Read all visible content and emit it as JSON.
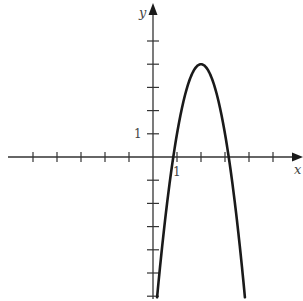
{
  "chart_data": {
    "type": "line",
    "title": "",
    "xlabel": "x",
    "ylabel": "y",
    "xlim": [
      -5.3,
      6.2
    ],
    "ylim": [
      -6.2,
      6.3
    ],
    "grid": false,
    "legend": null,
    "x_tick_step": 1,
    "y_tick_step": 1,
    "x_ticks": [
      -5,
      -4,
      -3,
      -2,
      -1,
      1,
      2,
      3,
      4,
      5
    ],
    "y_ticks": [
      -6,
      -5,
      -4,
      -3,
      -2,
      -1,
      1,
      2,
      3,
      4,
      5
    ],
    "tick_labels": {
      "x": "1",
      "y": "1"
    },
    "series": [
      {
        "name": "parabola",
        "equation_estimate": "y = -3(x - 2)^2 + 4",
        "vertex": [
          2,
          4
        ],
        "x_intercepts": [
          0.85,
          3.15
        ],
        "x": [
          0.17,
          0.5,
          0.85,
          1.0,
          1.5,
          2.0,
          2.5,
          3.0,
          3.15,
          3.5,
          3.83
        ],
        "values": [
          -6.0,
          -2.75,
          0.0,
          1.0,
          3.25,
          4.0,
          3.25,
          1.0,
          0.0,
          -2.75,
          -6.0
        ]
      }
    ]
  },
  "labels": {
    "x_axis": "x",
    "y_axis": "y",
    "x_tick_one": "1",
    "y_tick_one": "1"
  },
  "style": {
    "axis_color": "#333333",
    "curve_color": "#1a1a1a",
    "background": "#ffffff"
  }
}
